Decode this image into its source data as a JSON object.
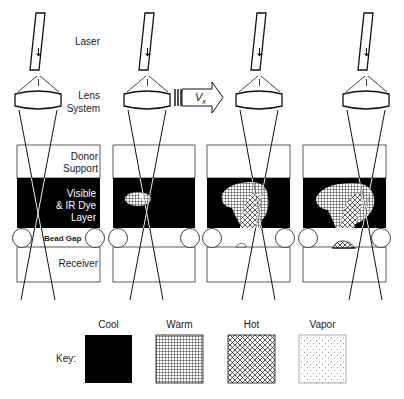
{
  "diagram": {
    "labels": {
      "laser": "Laser",
      "lens_line1": "Lens",
      "lens_line2": "System",
      "velocity": "V",
      "velocity_sub": "x",
      "donor_line1": "Donor",
      "donor_line2": "Support",
      "dye_line1": "Visible",
      "dye_line2": "& IR Dye",
      "dye_line3": "Layer",
      "bead_gap": "Bead Gap",
      "receiver": "Receiver"
    },
    "stages": [
      {
        "id": 1,
        "heating": "none"
      },
      {
        "id": 2,
        "heating": "warm spot"
      },
      {
        "id": 3,
        "heating": "warm + hot region, vapor onset"
      },
      {
        "id": 4,
        "heating": "warm + hot region, vapor transfer to receiver"
      }
    ],
    "key": {
      "title": "Key:",
      "items": [
        {
          "label": "Cool",
          "pattern": "solid-black"
        },
        {
          "label": "Warm",
          "pattern": "square-grid"
        },
        {
          "label": "Hot",
          "pattern": "diagonal-crosshatch"
        },
        {
          "label": "Vapor",
          "pattern": "dots"
        }
      ]
    },
    "colors": {
      "line": "#1a1a1a",
      "cool": "#000000",
      "background": "#ffffff"
    }
  }
}
